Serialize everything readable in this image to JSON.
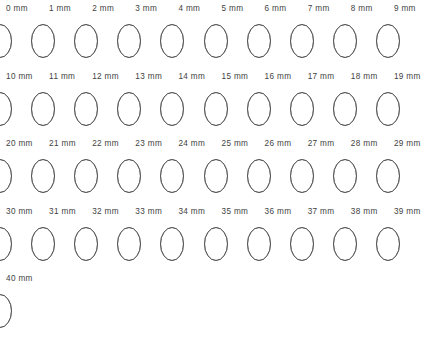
{
  "figure": {
    "units": "mm",
    "unit_suffix": " mm",
    "columns_per_row": 10,
    "outline_color": "#8c8c8c",
    "fill_color": "#4a4a4a",
    "label_color": "#3f3f3f",
    "background_color": "#ffffff",
    "ellipse": {
      "rx": 11.5,
      "ry": 16.5,
      "max_separation": 23.0,
      "min_separation": 0.0
    }
  },
  "chart_data": {
    "type": "diagram-series",
    "xlabel": "",
    "ylabel": "",
    "value_unit": "mm",
    "value_min": 0,
    "value_max": 40,
    "step": 1,
    "count": 41,
    "categories": [
      "0 mm",
      "1 mm",
      "2 mm",
      "3 mm",
      "4 mm",
      "5 mm",
      "6 mm",
      "7 mm",
      "8 mm",
      "9 mm",
      "10 mm",
      "11 mm",
      "12 mm",
      "13 mm",
      "14 mm",
      "15 mm",
      "16 mm",
      "17 mm",
      "18 mm",
      "19 mm",
      "20 mm",
      "21 mm",
      "22 mm",
      "23 mm",
      "24 mm",
      "25 mm",
      "26 mm",
      "27 mm",
      "28 mm",
      "29 mm",
      "30 mm",
      "31 mm",
      "32 mm",
      "33 mm",
      "34 mm",
      "35 mm",
      "36 mm",
      "37 mm",
      "38 mm",
      "39 mm",
      "40 mm"
    ],
    "values": [
      0,
      1,
      2,
      3,
      4,
      5,
      6,
      7,
      8,
      9,
      10,
      11,
      12,
      13,
      14,
      15,
      16,
      17,
      18,
      19,
      20,
      21,
      22,
      23,
      24,
      25,
      26,
      27,
      28,
      29,
      30,
      31,
      32,
      33,
      34,
      35,
      36,
      37,
      38,
      39,
      40
    ],
    "series": [
      {
        "name": "Centre separation (px)",
        "values": [
          23.0,
          22.43,
          21.85,
          21.28,
          20.7,
          20.13,
          19.55,
          18.98,
          18.4,
          17.83,
          17.25,
          16.68,
          16.1,
          15.53,
          14.95,
          14.38,
          13.8,
          13.23,
          12.65,
          12.08,
          11.5,
          10.93,
          10.35,
          9.78,
          9.2,
          8.63,
          8.05,
          7.48,
          6.9,
          6.33,
          5.75,
          5.18,
          4.6,
          4.03,
          3.45,
          2.88,
          2.3,
          1.73,
          1.15,
          0.58,
          0.0
        ]
      },
      {
        "name": "Overlap width (px)",
        "values": [
          0.0,
          0.58,
          1.15,
          1.73,
          2.3,
          2.88,
          3.45,
          4.03,
          4.6,
          5.18,
          5.75,
          6.33,
          6.9,
          7.48,
          8.05,
          8.63,
          9.2,
          9.78,
          10.35,
          10.93,
          11.5,
          12.08,
          12.65,
          13.23,
          13.8,
          14.38,
          14.95,
          15.53,
          16.1,
          16.68,
          17.25,
          17.83,
          18.4,
          18.98,
          19.55,
          20.13,
          20.7,
          21.28,
          21.85,
          22.43,
          23.0
        ]
      }
    ],
    "rows": [
      {
        "index": 0,
        "labels": [
          "0 mm",
          "1 mm",
          "2 mm",
          "3 mm",
          "4 mm",
          "5 mm",
          "6 mm",
          "7 mm",
          "8 mm",
          "9 mm"
        ]
      },
      {
        "index": 1,
        "labels": [
          "10 mm",
          "11 mm",
          "12 mm",
          "13 mm",
          "14 mm",
          "15 mm",
          "16 mm",
          "17 mm",
          "18 mm",
          "19 mm"
        ]
      },
      {
        "index": 2,
        "labels": [
          "20 mm",
          "21 mm",
          "22 mm",
          "23 mm",
          "24 mm",
          "25 mm",
          "26 mm",
          "27 mm",
          "28 mm",
          "29 mm"
        ]
      },
      {
        "index": 3,
        "labels": [
          "30 mm",
          "31 mm",
          "32 mm",
          "33 mm",
          "34 mm",
          "35 mm",
          "36 mm",
          "37 mm",
          "38 mm",
          "39 mm"
        ]
      },
      {
        "index": 4,
        "labels": [
          "40 mm"
        ]
      }
    ]
  }
}
